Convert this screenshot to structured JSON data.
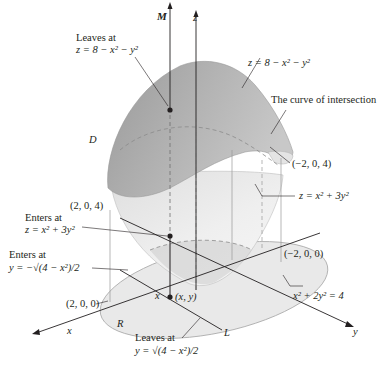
{
  "figure": {
    "axes": {
      "z": "z",
      "M": "M",
      "x": "x",
      "y": "y",
      "L": "L"
    },
    "region_labels": {
      "D": "D",
      "R": "R"
    },
    "annotations": {
      "leaves_top_line1": "Leaves at",
      "leaves_top_line2": "z = 8 − x² − y²",
      "upper_surface": "z = 8 − x² − y²",
      "curve_of_intersection": "The curve of intersection",
      "point_neg2_0_4": "(−2, 0, 4)",
      "lower_surface": "z = x² + 3y²",
      "point_2_0_4": "(2, 0, 4)",
      "enters_z_line1": "Enters at",
      "enters_z_line2": "z = x² + 3y²",
      "enters_y_line1": "Enters at",
      "enters_y_line2": "y = −√(4 − x²)/2",
      "point_neg2_0_0": "(−2, 0, 0)",
      "ellipse": "x² + 2y² = 4",
      "point_2_0_0": "(2, 0, 0)",
      "x_mark": "x",
      "point_xy": "(x, y)",
      "leaves_y_line1": "Leaves at",
      "leaves_y_line2": "y = √(4 − x²)/2"
    },
    "colors": {
      "upper_surface": "#a9a9a9",
      "lower_surface": "#e6e6e6",
      "ellipse_fill": "#e8e8e8",
      "lines": "#231f20"
    }
  }
}
